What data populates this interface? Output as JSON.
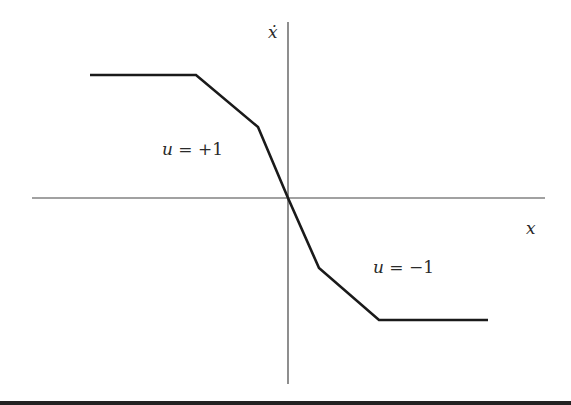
{
  "diagram": {
    "axes": {
      "x_label": "x",
      "y_label": "ẋ",
      "color": "#333333"
    },
    "curve": {
      "color": "#1a1a1a",
      "points": [
        [
          90,
          75
        ],
        [
          196,
          75
        ],
        [
          258,
          127
        ],
        [
          288,
          198
        ],
        [
          319,
          268
        ],
        [
          379,
          320
        ],
        [
          488,
          320
        ]
      ]
    },
    "regions": [
      {
        "var": "u",
        "eq": " = +1"
      },
      {
        "var": "u",
        "eq": " = −1"
      }
    ],
    "bottom_rule_color": "#222222"
  }
}
